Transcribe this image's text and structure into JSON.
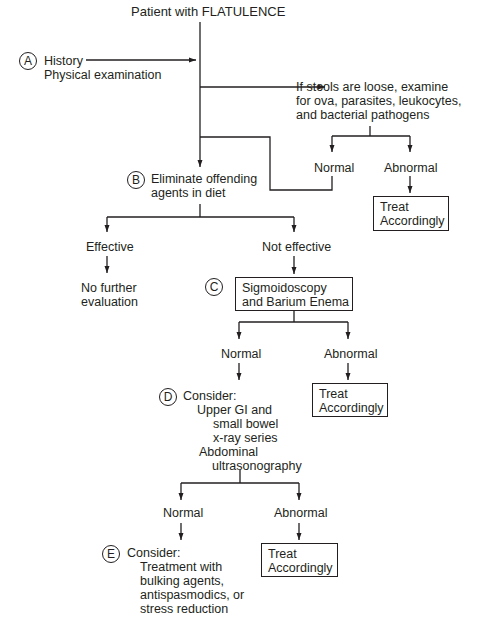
{
  "title": "Patient with FLATULENCE",
  "step_a": {
    "marker": "A",
    "lines": [
      "History",
      "Physical examination"
    ]
  },
  "stool_check": {
    "lines": [
      "If stools are loose, examine",
      "for ova, parasites, leukocytes,",
      "and bacterial pathogens"
    ],
    "normal_label": "Normal",
    "abnormal_label": "Abnormal",
    "treat_box": [
      "Treat",
      "Accordingly"
    ]
  },
  "step_b": {
    "marker": "B",
    "lines": [
      "Eliminate offending",
      "agents in diet"
    ],
    "effective_label": "Effective",
    "not_effective_label": "Not effective",
    "effective_result": [
      "No further",
      "evaluation"
    ]
  },
  "step_c": {
    "marker": "C",
    "box": [
      "Sigmoidoscopy",
      "and Barium Enema"
    ],
    "normal_label": "Normal",
    "abnormal_label": "Abnormal",
    "treat_box": [
      "Treat",
      "Accordingly"
    ]
  },
  "step_d": {
    "marker": "D",
    "heading": "Consider:",
    "lines": [
      "Upper GI and",
      "small bowel",
      "x-ray series",
      "Abdominal",
      "ultrasonography"
    ],
    "normal_label": "Normal",
    "abnormal_label": "Abnormal",
    "treat_box": [
      "Treat",
      "Accordingly"
    ]
  },
  "step_e": {
    "marker": "E",
    "heading": "Consider:",
    "lines": [
      "Treatment with",
      "bulking agents,",
      "antispasmodics, or",
      "stress reduction"
    ]
  },
  "colors": {
    "ink": "#231f20",
    "background": "#ffffff"
  }
}
